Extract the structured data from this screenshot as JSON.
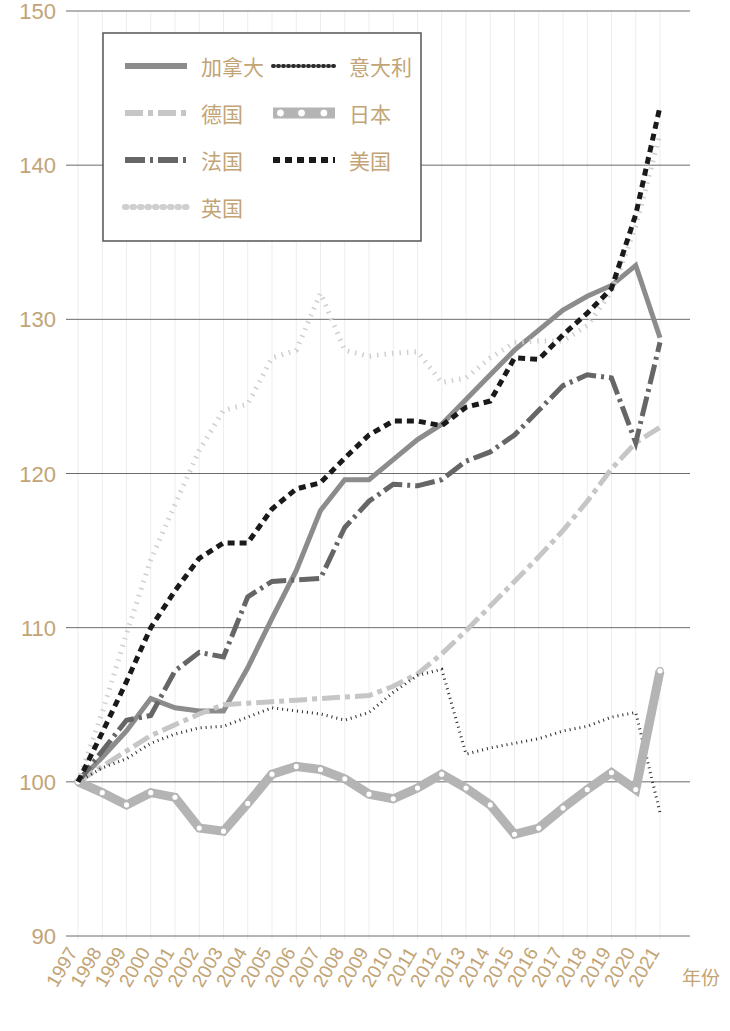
{
  "chart_data": {
    "type": "line",
    "title": "",
    "xlabel": "年份",
    "ylabel": "",
    "xlim": [
      1997,
      2021
    ],
    "ylim": [
      90,
      150
    ],
    "yticks": [
      90,
      100,
      110,
      120,
      130,
      140,
      150
    ],
    "grid": true,
    "legend_position": "top-left",
    "x": [
      1997,
      1998,
      1999,
      2000,
      2001,
      2002,
      2003,
      2004,
      2005,
      2006,
      2007,
      2008,
      2009,
      2010,
      2011,
      2012,
      2013,
      2014,
      2015,
      2016,
      2017,
      2018,
      2019,
      2020,
      2021
    ],
    "categories": [
      "1997",
      "1998",
      "1999",
      "2000",
      "2001",
      "2002",
      "2003",
      "2004",
      "2005",
      "2006",
      "2007",
      "2008",
      "2009",
      "2010",
      "2011",
      "2012",
      "2013",
      "2014",
      "2015",
      "2016",
      "2017",
      "2018",
      "2019",
      "2020",
      "2021"
    ],
    "series": [
      {
        "name": "加拿大",
        "key": "canada",
        "style": "solid",
        "color": "#8c8c8c",
        "width": 5,
        "dash": "none",
        "values": [
          100.0,
          101.6,
          103.3,
          105.4,
          104.8,
          104.6,
          104.6,
          107.4,
          110.6,
          113.7,
          117.6,
          119.6,
          119.6,
          120.9,
          122.2,
          123.2,
          124.8,
          126.4,
          128.0,
          129.3,
          130.6,
          131.5,
          132.2,
          133.5,
          128.8
        ]
      },
      {
        "name": "德国",
        "key": "germany",
        "style": "dash-dot",
        "color": "#c6c6c6",
        "width": 5,
        "dash": "18,5,5,5",
        "values": [
          100.0,
          101.0,
          102.0,
          103.0,
          103.7,
          104.4,
          105.0,
          105.1,
          105.2,
          105.3,
          105.4,
          105.5,
          105.6,
          106.2,
          107.0,
          108.3,
          109.8,
          111.4,
          113.0,
          114.6,
          116.3,
          118.2,
          120.3,
          122.0,
          123.0
        ]
      },
      {
        "name": "法国",
        "key": "france",
        "style": "dash-dot",
        "color": "#666666",
        "width": 5,
        "dash": "20,5,3,5",
        "values": [
          100.0,
          102.0,
          104.0,
          104.3,
          107.2,
          108.4,
          108.1,
          112.0,
          113.0,
          113.1,
          113.2,
          116.5,
          118.2,
          119.3,
          119.2,
          119.6,
          120.8,
          121.4,
          122.5,
          124.1,
          125.7,
          126.4,
          126.2,
          122.0,
          128.5
        ]
      },
      {
        "name": "英国",
        "key": "uk",
        "style": "dotted",
        "color": "#cfcfcf",
        "width": 5,
        "dash": "1.5,6",
        "values": [
          100.0,
          104.5,
          109.6,
          114.4,
          118.0,
          121.5,
          124.1,
          124.5,
          127.5,
          128.0,
          131.7,
          128.0,
          127.6,
          127.8,
          127.9,
          125.9,
          126.2,
          127.5,
          128.5,
          128.6,
          128.6,
          129.6,
          131.8,
          136.0,
          142.0
        ]
      },
      {
        "name": "意大利",
        "key": "italy",
        "style": "fine-dotted",
        "color": "#2b2b2b",
        "width": 3,
        "dash": "1,4",
        "values": [
          100.0,
          100.9,
          101.5,
          102.5,
          103.1,
          103.5,
          103.6,
          104.2,
          104.8,
          104.6,
          104.4,
          104.0,
          104.5,
          105.8,
          106.9,
          107.3,
          101.8,
          102.2,
          102.5,
          102.8,
          103.3,
          103.6,
          104.2,
          104.5,
          98.0
        ]
      },
      {
        "name": "日本",
        "key": "japan",
        "style": "circle-marker",
        "color": "#b4b4b4",
        "width": 9,
        "dash": "none",
        "values": [
          100.0,
          99.3,
          98.5,
          99.3,
          99.0,
          97.0,
          96.8,
          98.6,
          100.5,
          101.0,
          100.8,
          100.2,
          99.2,
          98.9,
          99.6,
          100.5,
          99.6,
          98.5,
          96.6,
          97.0,
          98.3,
          99.5,
          100.6,
          99.5,
          107.2
        ]
      },
      {
        "name": "美国",
        "key": "usa",
        "style": "dashed",
        "color": "#1a1a1a",
        "width": 5,
        "dash": "7,5",
        "values": [
          100.0,
          103.2,
          106.5,
          110.0,
          112.4,
          114.5,
          115.5,
          115.5,
          117.7,
          119.0,
          119.4,
          121.0,
          122.5,
          123.4,
          123.4,
          123.1,
          124.3,
          124.7,
          127.5,
          127.4,
          129.0,
          130.4,
          132.0,
          136.8,
          143.8
        ]
      }
    ],
    "note_italy_2021": 104.0,
    "note_japan_dip": 96.6
  },
  "legend": {
    "items": [
      {
        "label": "加拿大",
        "key": "canada"
      },
      {
        "label": "意大利",
        "key": "italy"
      },
      {
        "label": "德国",
        "key": "germany"
      },
      {
        "label": "日本",
        "key": "japan"
      },
      {
        "label": "法国",
        "key": "france"
      },
      {
        "label": "美国",
        "key": "usa"
      },
      {
        "label": "英国",
        "key": "uk"
      }
    ]
  },
  "axis": {
    "y_labels": [
      "150",
      "140",
      "130",
      "120",
      "110",
      "100",
      "90"
    ],
    "x_labels": [
      "1997",
      "1998",
      "1999",
      "2000",
      "2001",
      "2002",
      "2003",
      "2004",
      "2005",
      "2006",
      "2007",
      "2008",
      "2009",
      "2010",
      "2011",
      "2012",
      "2013",
      "2014",
      "2015",
      "2016",
      "2017",
      "2018",
      "2019",
      "2020",
      "2021"
    ],
    "x_title": "年份"
  },
  "colors": {
    "tick_text": "#c2a476",
    "gridline": "#6b6b6b",
    "vgrid": "#ededed",
    "legend_border": "#555555",
    "background": "#ffffff"
  }
}
